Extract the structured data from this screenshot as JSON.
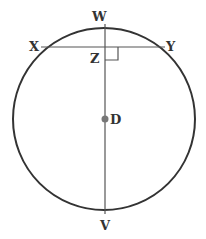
{
  "diagram": {
    "type": "circle-geometry",
    "circle": {
      "center_label": "D",
      "cx": 104,
      "cy": 119,
      "r": 91,
      "stroke": "#333333"
    },
    "points": {
      "W": {
        "label": "W",
        "x": 105,
        "y": 24
      },
      "X": {
        "label": "X",
        "x": 41,
        "y": 47
      },
      "Y": {
        "label": "Y",
        "x": 165,
        "y": 47
      },
      "Z": {
        "label": "Z",
        "x": 105,
        "y": 47
      },
      "D": {
        "label": "D",
        "x": 105,
        "y": 119
      },
      "V": {
        "label": "V",
        "x": 105,
        "y": 214
      }
    },
    "segments": [
      {
        "name": "chord-XY",
        "from": "X",
        "to": "Y"
      },
      {
        "name": "diameter-WV",
        "from": "W",
        "to": "V"
      }
    ],
    "right_angle_at": "Z",
    "colors": {
      "line": "#333333",
      "center_dot": "#777777",
      "thin_line": "#555555"
    }
  }
}
